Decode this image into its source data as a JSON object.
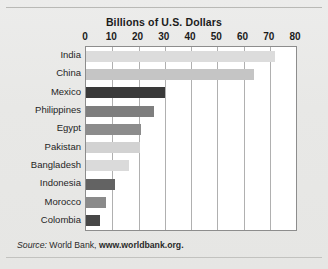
{
  "chart_data": {
    "type": "bar",
    "orientation": "horizontal",
    "title": "Billions of U.S. Dollars",
    "xlabel": "",
    "ylabel": "",
    "xlim": [
      0,
      80
    ],
    "xticks": [
      0,
      10,
      20,
      30,
      40,
      50,
      60,
      70,
      80
    ],
    "xtick_labels": [
      "0",
      "10",
      "20",
      "30",
      "40",
      "50",
      "60",
      "70",
      "80"
    ],
    "grid": true,
    "grid_axis": "x",
    "legend": false,
    "categories": [
      "India",
      "China",
      "Mexico",
      "Philippines",
      "Egypt",
      "Pakistan",
      "Bangladesh",
      "Indonesia",
      "Morocco",
      "Colombia"
    ],
    "values": [
      72,
      64,
      30,
      26,
      21,
      20.5,
      16.5,
      11,
      7.5,
      5.5
    ],
    "bar_colors": [
      "#dcdcdc",
      "#c5c5c5",
      "#3a3a3a",
      "#7e7e7e",
      "#8c8c8c",
      "#d2d2d2",
      "#dadada",
      "#636363",
      "#8a8a8a",
      "#474747"
    ],
    "annotations": {
      "source_label": "Source:",
      "source_text": " World Bank, ",
      "source_url": "www.worldbank.org."
    }
  },
  "figure": {
    "background_color": "#e9e9e7",
    "plot_background_color": "#ffffff",
    "axis_color": "#8d8d8d",
    "gridline_color": "#b0b0b0",
    "text_color": "#1b1b1b"
  }
}
